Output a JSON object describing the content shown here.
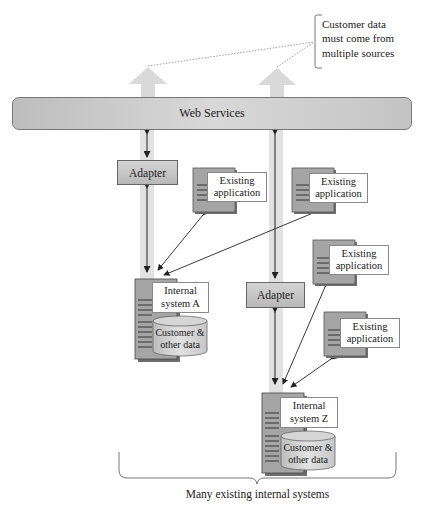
{
  "diagram": {
    "callout": "Customer data\nmust come from\nmultiple sources",
    "web_services": "Web Services",
    "adapters": [
      {
        "label": "Adapter"
      },
      {
        "label": "Adapter"
      }
    ],
    "existing_applications": [
      {
        "label": "Existing\napplication"
      },
      {
        "label": "Existing\napplication"
      },
      {
        "label": "Existing\napplication"
      },
      {
        "label": "Existing\napplication"
      }
    ],
    "internal_systems": [
      {
        "label": "Internal\nsystem A",
        "data": "Customer &\nother data"
      },
      {
        "label": "Internal\nsystem Z",
        "data": "Customer &\nother data"
      }
    ],
    "caption": "Many existing internal systems",
    "colors": {
      "arrow_fill": "#d9d9d9",
      "server_dark": "#7a7a7a",
      "server_mid": "#a8a8a8",
      "bar_gray": "#c8c8c8"
    }
  }
}
